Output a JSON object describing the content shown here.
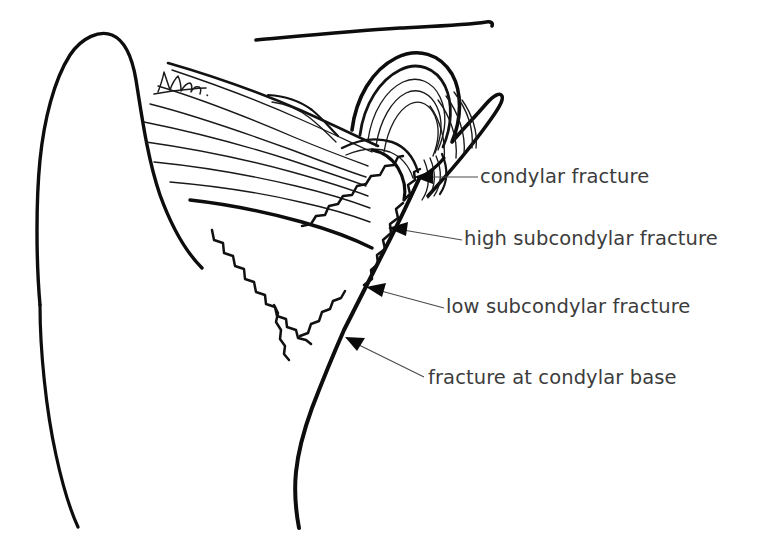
{
  "figure": {
    "background_color": "#ffffff",
    "ink_color": "#0d0d0d",
    "label_color": "#3c3c3c",
    "leader_color": "#4a4a4a",
    "width": 760,
    "height": 537
  },
  "annotations": [
    {
      "id": "condylar-fracture",
      "label": "condylar fracture",
      "arrow_tip": {
        "x": 414,
        "y": 177
      },
      "leader_end": {
        "x": 478,
        "y": 177
      }
    },
    {
      "id": "high-subcondylar-fracture",
      "label": "high subcondylar fracture",
      "arrow_tip": {
        "x": 388,
        "y": 228
      },
      "leader_end": {
        "x": 462,
        "y": 240
      }
    },
    {
      "id": "low-subcondylar-fracture",
      "label": "low subcondylar fracture",
      "arrow_tip": {
        "x": 366,
        "y": 287
      },
      "leader_end": {
        "x": 444,
        "y": 308
      }
    },
    {
      "id": "fracture-at-condylar-base",
      "label": "fracture at condylar base",
      "arrow_tip": {
        "x": 345,
        "y": 337
      },
      "leader_end": {
        "x": 424,
        "y": 377
      }
    }
  ],
  "drawing_parts": {
    "zygomatic_arch": "skull-base-line",
    "coronoid_process": "coronoid-process-outline",
    "condylar_head": "condylar-head-outline",
    "joint_capsule": "joint-capsule-layers",
    "muscle_fibers": "lateral-pterygoid-fibers",
    "ramus_posterior_border": "ramus-posterior-border",
    "sigmoid_notch": "sigmoid-notch",
    "fracture_lines": [
      "condylar-fracture-line",
      "high-subcondylar-fracture-line",
      "low-subcondylar-fracture-line",
      "condylar-base-fracture-line"
    ],
    "artist_signature": "handwritten-signature"
  }
}
